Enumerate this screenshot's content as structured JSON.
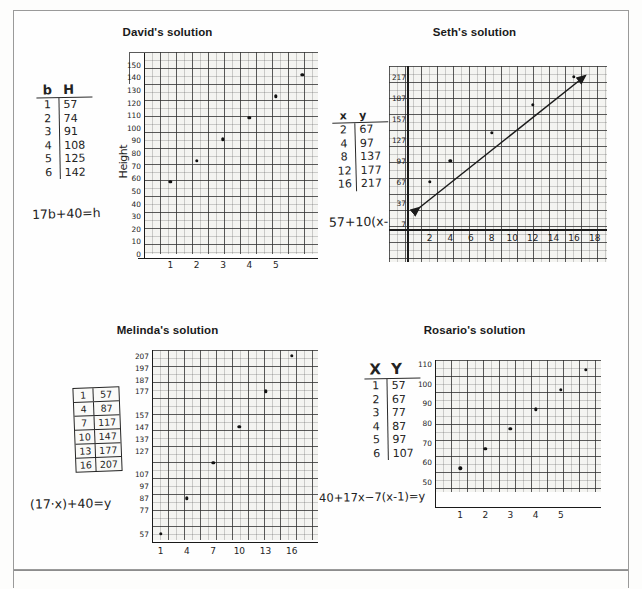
{
  "worksheet": {
    "title_hidden": "",
    "quadrants": [
      {
        "id": "david",
        "title": "David's solution",
        "table": {
          "headers": [
            "b",
            "H"
          ],
          "rows": [
            [
              "1",
              "57"
            ],
            [
              "2",
              "74"
            ],
            [
              "3",
              "91"
            ],
            [
              "4",
              "108"
            ],
            [
              "5",
              "125"
            ],
            [
              "6",
              "142"
            ]
          ]
        },
        "equation": "17b+40=h",
        "chart_data": {
          "type": "scatter",
          "title": "David's solution",
          "xlabel": "",
          "ylabel": "Height",
          "x": [
            1,
            2,
            3,
            4,
            5,
            6
          ],
          "values": [
            57,
            74,
            91,
            108,
            125,
            142
          ],
          "xticks": [
            "1",
            "2",
            "3",
            "4",
            "5"
          ],
          "yticks": [
            "150",
            "140",
            "130",
            "120",
            "110",
            "100",
            "90",
            "80",
            "70",
            "60",
            "50",
            "40",
            "30",
            "20",
            "10",
            "0"
          ],
          "xlim": [
            0,
            6.6
          ],
          "ylim": [
            0,
            160
          ],
          "grid": true,
          "legend": "none"
        }
      },
      {
        "id": "seth",
        "title": "Seth's solution",
        "table": {
          "headers": [
            "x",
            "y"
          ],
          "rows": [
            [
              "2",
              "67"
            ],
            [
              "4",
              "97"
            ],
            [
              "8",
              "137"
            ],
            [
              "12",
              "177"
            ],
            [
              "16",
              "217"
            ]
          ]
        },
        "equation": "57+10(x-1)",
        "chart_data": {
          "type": "scatter",
          "title": "Seth's solution",
          "xlabel": "",
          "ylabel": "",
          "x": [
            2,
            4,
            8,
            12,
            16
          ],
          "values": [
            67,
            97,
            137,
            177,
            217
          ],
          "xticks": [
            "2",
            "4",
            "6",
            "8",
            "10",
            "12",
            "14",
            "16",
            "18"
          ],
          "yticks": [
            "217",
            "187",
            "157",
            "127",
            "97",
            "67",
            "37",
            "7"
          ],
          "xlim": [
            0,
            19
          ],
          "ylim": [
            0,
            232
          ],
          "grid": true,
          "trendline": true,
          "legend": "none"
        }
      },
      {
        "id": "melinda",
        "title": "Melinda's solution",
        "table": {
          "headers": [
            "",
            ""
          ],
          "rows": [
            [
              "1",
              "57"
            ],
            [
              "4",
              "87"
            ],
            [
              "7",
              "117"
            ],
            [
              "10",
              "147"
            ],
            [
              "13",
              "177"
            ],
            [
              "16",
              "207"
            ]
          ]
        },
        "equation": "(17·x)+40=y",
        "chart_data": {
          "type": "scatter",
          "title": "Melinda's solution",
          "xlabel": "",
          "ylabel": "",
          "x": [
            1,
            4,
            7,
            10,
            13,
            16
          ],
          "values": [
            57,
            87,
            117,
            147,
            177,
            207
          ],
          "xticks": [
            "1",
            "4",
            "7",
            "10",
            "13",
            "16"
          ],
          "yticks": [
            "207",
            "197",
            "187",
            "177",
            "157",
            "147",
            "137",
            "127",
            "107",
            "97",
            "87",
            "77",
            "57"
          ],
          "xlim": [
            0,
            19
          ],
          "ylim": [
            50,
            212
          ],
          "grid": true,
          "legend": "none"
        }
      },
      {
        "id": "rosario",
        "title": "Rosario's solution",
        "table": {
          "headers": [
            "X",
            "Y"
          ],
          "rows": [
            [
              "1",
              "57"
            ],
            [
              "2",
              "67"
            ],
            [
              "3",
              "77"
            ],
            [
              "4",
              "87"
            ],
            [
              "5",
              "97"
            ],
            [
              "6",
              "107"
            ]
          ]
        },
        "equation": "40+17x−7(x-1)=y",
        "chart_data": {
          "type": "scatter",
          "title": "Rosario's solution",
          "xlabel": "",
          "ylabel": "",
          "x": [
            1,
            2,
            3,
            4,
            5,
            6
          ],
          "values": [
            57,
            67,
            77,
            87,
            97,
            107
          ],
          "xticks": [
            "1",
            "2",
            "3",
            "4",
            "5"
          ],
          "yticks": [
            "110",
            "100",
            "90",
            "80",
            "70",
            "60",
            "50"
          ],
          "xlim": [
            0,
            6.6
          ],
          "ylim": [
            45,
            112
          ],
          "grid": true,
          "legend": "none"
        }
      }
    ]
  },
  "colors": {
    "page_background": "#fdfdfc",
    "frame": "#9a9a9a",
    "ink": "#232323",
    "grid": "#4b4b4b",
    "graph_paper": "#f3f3f0"
  }
}
